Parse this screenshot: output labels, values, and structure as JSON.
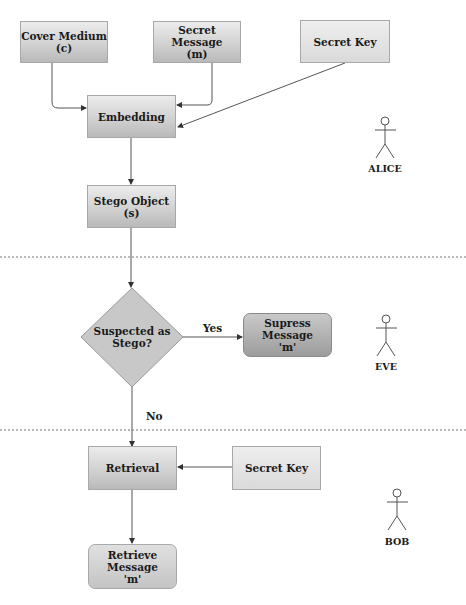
{
  "diagram": {
    "alice_section": {
      "cover_medium": "Cover Medium\n(c)",
      "secret_message": "Secret Message\n(m)",
      "secret_key": "Secret Key",
      "embedding": "Embedding",
      "stego_object": "Stego Object\n(s)",
      "actor": "ALICE"
    },
    "eve_section": {
      "decision": "Suspected as\nStego?",
      "yes_label": "Yes",
      "no_label": "No",
      "suppress": "Supress\nMessage\n'm'",
      "actor": "EVE"
    },
    "bob_section": {
      "retrieval": "Retrieval",
      "secret_key": "Secret Key",
      "retrieve_message": "Retrieve\nMessage\n'm'",
      "actor": "BOB"
    },
    "colors": {
      "box_fill_top": "#ececec",
      "box_fill_bottom": "#b9b9b9",
      "suppress_fill": "#9c9c9c",
      "line": "#555555",
      "divider": "#777777"
    }
  }
}
